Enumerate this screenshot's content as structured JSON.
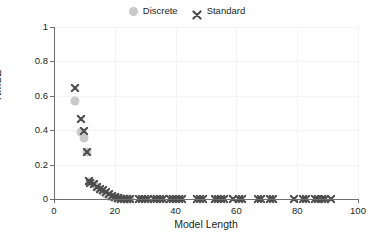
{
  "chart_data": {
    "type": "scatter",
    "title": "",
    "xlabel": "Model Length",
    "ylabel": "NMSE",
    "xlim": [
      0,
      100
    ],
    "ylim": [
      0,
      1
    ],
    "xticks": [
      0,
      20,
      40,
      60,
      80,
      100
    ],
    "yticks": [
      0,
      0.2,
      0.4,
      0.6,
      0.8,
      1
    ],
    "xticklabels": [
      "0",
      "20",
      "40",
      "60",
      "80",
      "100"
    ],
    "yticklabels": [
      "0",
      "0.2",
      "0.4",
      "0.6",
      "0.8",
      "1"
    ],
    "grid": true,
    "legend_position": "top-center",
    "series": [
      {
        "name": "Discrete",
        "marker": "circle",
        "color": "#c9c9c9",
        "points": [
          [
            7,
            0.57
          ],
          [
            9,
            0.39
          ],
          [
            10,
            0.355
          ],
          [
            11,
            0.275
          ],
          [
            12,
            0.1
          ],
          [
            13,
            0.085
          ],
          [
            14,
            0.07
          ],
          [
            15,
            0.055
          ],
          [
            16,
            0.04
          ],
          [
            17,
            0.03
          ],
          [
            18,
            0.02
          ],
          [
            19,
            0.012
          ],
          [
            20,
            0.007
          ],
          [
            21,
            0.004
          ],
          [
            22,
            0.003
          ],
          [
            23,
            0.002
          ],
          [
            24,
            0.001
          ],
          [
            25,
            0.001
          ]
        ]
      },
      {
        "name": "Standard",
        "marker": "x",
        "color": "#4d4d4d",
        "points": [
          [
            7,
            0.645
          ],
          [
            9,
            0.465
          ],
          [
            10,
            0.395
          ],
          [
            11,
            0.275
          ],
          [
            11.5,
            0.105
          ],
          [
            12,
            0.095
          ],
          [
            13,
            0.085
          ],
          [
            14,
            0.072
          ],
          [
            15,
            0.06
          ],
          [
            16,
            0.05
          ],
          [
            17,
            0.04
          ],
          [
            18,
            0.028
          ],
          [
            19,
            0.018
          ],
          [
            20,
            0.009
          ],
          [
            21,
            0.004
          ],
          [
            22,
            0.002
          ],
          [
            23,
            0.001
          ],
          [
            24,
            0.001
          ],
          [
            25,
            0.0
          ],
          [
            28,
            0.0
          ],
          [
            29,
            0.0
          ],
          [
            30,
            0.0
          ],
          [
            31,
            0.0
          ],
          [
            33,
            0.0
          ],
          [
            34,
            0.0
          ],
          [
            35,
            0.0
          ],
          [
            36,
            0.0
          ],
          [
            38,
            0.0
          ],
          [
            39,
            0.0
          ],
          [
            40,
            0.0
          ],
          [
            41,
            0.0
          ],
          [
            42,
            0.0
          ],
          [
            47,
            0.0
          ],
          [
            48,
            0.0
          ],
          [
            49,
            0.0
          ],
          [
            53,
            0.0
          ],
          [
            54,
            0.0
          ],
          [
            55,
            0.0
          ],
          [
            56,
            0.0
          ],
          [
            59,
            0.0
          ],
          [
            61,
            0.0
          ],
          [
            62,
            0.0
          ],
          [
            67,
            0.0
          ],
          [
            68,
            0.0
          ],
          [
            71,
            0.0
          ],
          [
            72,
            0.0
          ],
          [
            79,
            0.0
          ],
          [
            82,
            0.0
          ],
          [
            83,
            0.0
          ],
          [
            86,
            0.0
          ],
          [
            87,
            0.0
          ],
          [
            88,
            0.0
          ],
          [
            89,
            0.0
          ],
          [
            91,
            0.0
          ]
        ]
      }
    ]
  },
  "legend": {
    "entries": [
      {
        "label": "Discrete",
        "marker": "circle",
        "color": "#c9c9c9"
      },
      {
        "label": "Standard",
        "marker": "x",
        "color": "#4d4d4d"
      }
    ]
  },
  "axes": {
    "xlabel": "Model Length",
    "ylabel": "NMSE"
  }
}
